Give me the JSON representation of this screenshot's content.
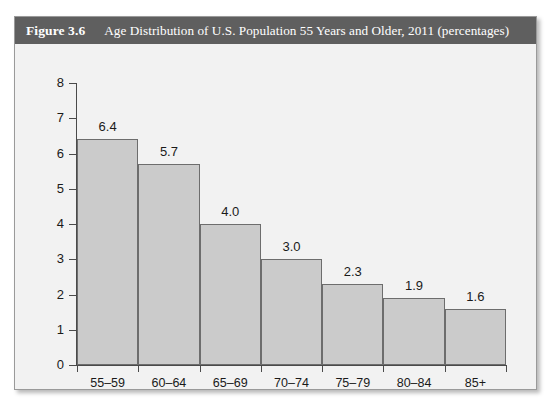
{
  "figure": {
    "number": "Figure 3.6",
    "title": "Age Distribution of U.S. Population 55 Years and Older, 2011 (percentages)",
    "header_bg": "#5f5f5f",
    "header_text_color": "#ffffff",
    "panel_bg": "#f2f2f2",
    "border_color": "#9a9a9a"
  },
  "chart_data": {
    "type": "bar",
    "title": "Age Distribution of U.S. Population 55 Years and Older, 2011 (percentages)",
    "xlabel": "",
    "ylabel": "",
    "categories": [
      "55–59",
      "60–64",
      "65–69",
      "70–74",
      "75–79",
      "80–84",
      "85+"
    ],
    "values": [
      6.4,
      5.7,
      4.0,
      3.0,
      2.3,
      1.9,
      1.6
    ],
    "value_labels": [
      "6.4",
      "5.7",
      "4.0",
      "3.0",
      "2.3",
      "1.9",
      "1.6"
    ],
    "ylim": [
      0,
      8
    ],
    "yticks": [
      0,
      1,
      2,
      3,
      4,
      5,
      6,
      7,
      8
    ],
    "ytick_labels": [
      "0",
      "1",
      "2",
      "3",
      "4",
      "5",
      "6",
      "7",
      "8"
    ],
    "grid": false,
    "legend": false,
    "bar_fill": "#cbcbcb",
    "bar_stroke": "#6d6d6d",
    "axis_color": "#4a4a4a"
  }
}
